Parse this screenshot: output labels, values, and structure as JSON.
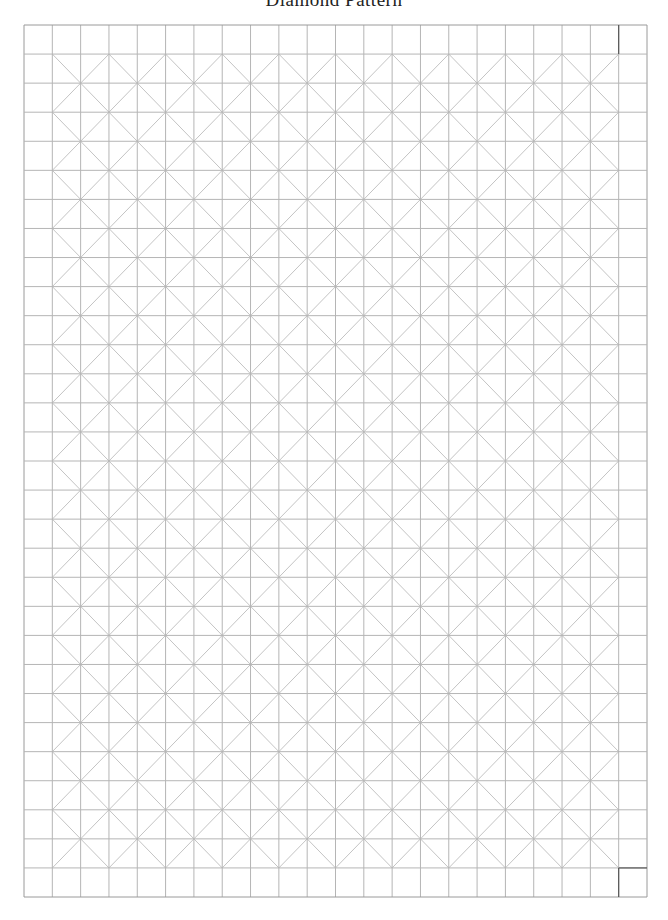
{
  "page": {
    "title": "Diamond Pattern"
  },
  "grid": {
    "columns": 22,
    "rows": 30,
    "left": 24,
    "top": 25,
    "right": 647,
    "bottom": 897,
    "line_color": "#b5b5b5",
    "diagonal_color": "#c4c4c4",
    "border_color": "#9a9a9a",
    "pattern": "diamond-lattice",
    "diagonal_region": {
      "col_start": 1,
      "col_end": 21,
      "row_start": 1,
      "row_end": 29
    }
  }
}
